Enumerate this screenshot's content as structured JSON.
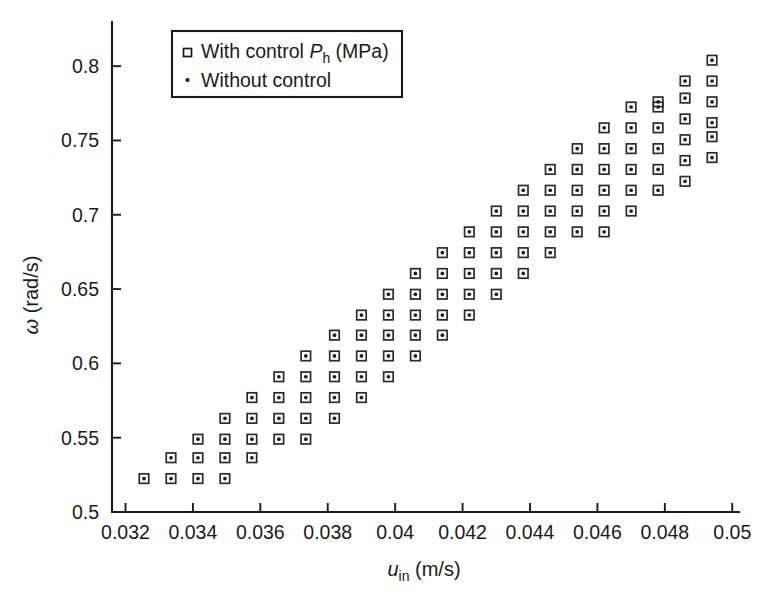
{
  "chart_data": {
    "type": "scatter",
    "title": "",
    "xlabel": "u_in (m/s)",
    "xlabel_main": "u",
    "xlabel_sub": "in",
    "xlabel_unit": " (m/s)",
    "ylabel": "ω (rad/s)",
    "ylabel_main": "ω",
    "ylabel_unit": " (rad/s)",
    "xlim": [
      0.0316,
      0.0502
    ],
    "ylim": [
      0.5,
      0.8297
    ],
    "xticks": [
      0.032,
      0.034,
      0.036,
      0.038,
      0.04,
      0.042,
      0.044,
      0.046,
      0.048,
      0.05
    ],
    "xticklabels": [
      "0.032",
      "0.034",
      "0.036",
      "0.038",
      "0.04",
      "0.042",
      "0.044",
      "0.046",
      "0.048",
      "0.05"
    ],
    "yticks": [
      0.5,
      0.55,
      0.6,
      0.65,
      0.7,
      0.75,
      0.8
    ],
    "yticklabels": [
      "0.5",
      "0.55",
      "0.6",
      "0.65",
      "0.7",
      "0.75",
      "0.8"
    ],
    "grid": false,
    "legend_position": "top-left",
    "marker_color": "#2b2b2b",
    "axis_color": "#1a1a1a",
    "legend": [
      {
        "label": "With control P_h (MPa)",
        "label_main": "With control ",
        "label_italic": "P",
        "label_sub": "h",
        "label_tail": " (MPa)",
        "marker": "open-square"
      },
      {
        "label": "Without control",
        "label_main": "Without control",
        "label_italic": "",
        "label_sub": "",
        "label_tail": "",
        "marker": "dot"
      }
    ],
    "series": [
      {
        "name": "With control P_h (MPa)",
        "marker": "open-square-with-dot",
        "points": [
          [
            0.03255,
            0.5225
          ],
          [
            0.03335,
            0.5225
          ],
          [
            0.03335,
            0.5365
          ],
          [
            0.03415,
            0.5225
          ],
          [
            0.03415,
            0.5365
          ],
          [
            0.03415,
            0.549
          ],
          [
            0.03495,
            0.5225
          ],
          [
            0.03495,
            0.5365
          ],
          [
            0.03495,
            0.549
          ],
          [
            0.03495,
            0.563
          ],
          [
            0.03575,
            0.5365
          ],
          [
            0.03575,
            0.549
          ],
          [
            0.03575,
            0.563
          ],
          [
            0.03575,
            0.577
          ],
          [
            0.03655,
            0.549
          ],
          [
            0.03655,
            0.563
          ],
          [
            0.03655,
            0.577
          ],
          [
            0.03655,
            0.591
          ],
          [
            0.03735,
            0.549
          ],
          [
            0.03735,
            0.563
          ],
          [
            0.03735,
            0.577
          ],
          [
            0.03735,
            0.591
          ],
          [
            0.03735,
            0.605
          ],
          [
            0.0382,
            0.563
          ],
          [
            0.0382,
            0.577
          ],
          [
            0.0382,
            0.591
          ],
          [
            0.0382,
            0.605
          ],
          [
            0.0382,
            0.619
          ],
          [
            0.039,
            0.577
          ],
          [
            0.039,
            0.591
          ],
          [
            0.039,
            0.605
          ],
          [
            0.039,
            0.619
          ],
          [
            0.039,
            0.6325
          ],
          [
            0.0398,
            0.591
          ],
          [
            0.0398,
            0.605
          ],
          [
            0.0398,
            0.619
          ],
          [
            0.0398,
            0.6325
          ],
          [
            0.0398,
            0.6465
          ],
          [
            0.0406,
            0.605
          ],
          [
            0.0406,
            0.619
          ],
          [
            0.0406,
            0.6325
          ],
          [
            0.0406,
            0.6465
          ],
          [
            0.0406,
            0.6605
          ],
          [
            0.0414,
            0.619
          ],
          [
            0.0414,
            0.6325
          ],
          [
            0.0414,
            0.6465
          ],
          [
            0.0414,
            0.6605
          ],
          [
            0.0414,
            0.6745
          ],
          [
            0.0422,
            0.6325
          ],
          [
            0.0422,
            0.6465
          ],
          [
            0.0422,
            0.6605
          ],
          [
            0.0422,
            0.6745
          ],
          [
            0.0422,
            0.6885
          ],
          [
            0.043,
            0.6465
          ],
          [
            0.043,
            0.6605
          ],
          [
            0.043,
            0.6745
          ],
          [
            0.043,
            0.6885
          ],
          [
            0.043,
            0.7025
          ],
          [
            0.0438,
            0.6605
          ],
          [
            0.0438,
            0.6745
          ],
          [
            0.0438,
            0.6885
          ],
          [
            0.0438,
            0.7025
          ],
          [
            0.0438,
            0.7165
          ],
          [
            0.0446,
            0.6745
          ],
          [
            0.0446,
            0.6885
          ],
          [
            0.0446,
            0.7025
          ],
          [
            0.0446,
            0.7165
          ],
          [
            0.0446,
            0.7305
          ],
          [
            0.0454,
            0.6885
          ],
          [
            0.0454,
            0.7025
          ],
          [
            0.0454,
            0.7165
          ],
          [
            0.0454,
            0.7305
          ],
          [
            0.0454,
            0.7445
          ],
          [
            0.0462,
            0.6885
          ],
          [
            0.0462,
            0.7025
          ],
          [
            0.0462,
            0.7165
          ],
          [
            0.0462,
            0.7305
          ],
          [
            0.0462,
            0.7445
          ],
          [
            0.0462,
            0.7585
          ],
          [
            0.047,
            0.7025
          ],
          [
            0.047,
            0.7165
          ],
          [
            0.047,
            0.7305
          ],
          [
            0.047,
            0.7445
          ],
          [
            0.047,
            0.7585
          ],
          [
            0.047,
            0.7725
          ],
          [
            0.0478,
            0.7165
          ],
          [
            0.0478,
            0.7305
          ],
          [
            0.0478,
            0.7445
          ],
          [
            0.0478,
            0.7585
          ],
          [
            0.0478,
            0.7725
          ],
          [
            0.0478,
            0.776
          ],
          [
            0.0486,
            0.7225
          ],
          [
            0.0486,
            0.7365
          ],
          [
            0.0486,
            0.7505
          ],
          [
            0.0486,
            0.7645
          ],
          [
            0.0486,
            0.7785
          ],
          [
            0.0486,
            0.79
          ],
          [
            0.0494,
            0.7385
          ],
          [
            0.0494,
            0.7525
          ],
          [
            0.0494,
            0.762
          ],
          [
            0.0494,
            0.776
          ],
          [
            0.0494,
            0.79
          ],
          [
            0.0494,
            0.804
          ]
        ]
      },
      {
        "name": "Without control",
        "marker": "dot",
        "note": "coincident dot at the centre of each square marker"
      }
    ]
  }
}
